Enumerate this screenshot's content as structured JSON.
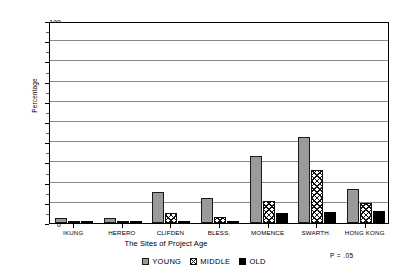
{
  "chart_data": {
    "type": "bar",
    "title": "",
    "xlabel": "The Sites of Project Age",
    "ylabel": "Percentage",
    "ylim": [
      0,
      100
    ],
    "ytick_step": 10,
    "grid": true,
    "legend_position": "bottom",
    "annotation": "P = .05",
    "categories": [
      "IKUNG",
      "HERERO",
      "CLIFDEN",
      "BLESS.",
      "MOMENCE",
      "SWARTH.",
      "HONG KONG"
    ],
    "ytick_labels": [
      "0",
      "10",
      "20",
      "30",
      "40",
      "50",
      "60",
      "70",
      "80",
      "90",
      "100"
    ],
    "series": [
      {
        "name": "YOUNG",
        "pattern": "gray-solid",
        "color": "#9a9a9a",
        "values": [
          2.5,
          2.5,
          15.5,
          12.5,
          33.0,
          42.5,
          17.0
        ]
      },
      {
        "name": "MIDDLE",
        "pattern": "cross-hatch",
        "color": "#ffffff",
        "values": [
          0.5,
          0.5,
          5.0,
          3.0,
          11.0,
          26.0,
          10.0
        ]
      },
      {
        "name": "OLD",
        "pattern": "black-solid",
        "color": "#000000",
        "values": [
          1.0,
          0.5,
          1.0,
          1.0,
          5.0,
          5.5,
          6.0
        ]
      }
    ]
  }
}
